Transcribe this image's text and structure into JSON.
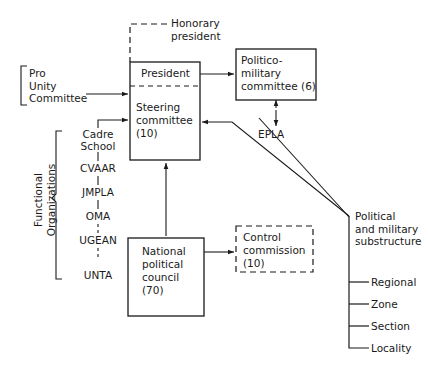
{
  "diagram": {
    "line_color": "#1a1a1a",
    "text_color": "#1a1a1a",
    "background": "#ffffff"
  },
  "nodes": {
    "honorary_president": {
      "label": "Honorary\npresident",
      "style": "dashed-connector-label"
    },
    "pro_unity_committee": {
      "label": "Pro\nUnity\nCommittee",
      "style": "bracket-group"
    },
    "president": {
      "label": "President",
      "style": "solid-box-upper-compartment"
    },
    "steering_committee": {
      "label": "Steering\ncommittee\n(10)",
      "count": "(10)",
      "style": "solid-box-lower-compartment"
    },
    "politico_military_committee": {
      "label": "Politico-\nmilitary\ncommittee (6)",
      "count": "(6)",
      "style": "solid-box"
    },
    "epla": {
      "label": "EPLA",
      "style": "edge-label"
    },
    "national_political_council": {
      "label": "National\npolitical\ncouncil\n(70)",
      "count": "(70)",
      "style": "solid-box"
    },
    "control_commission": {
      "label": "Control\ncommission\n(10)",
      "count": "(10)",
      "style": "dashed-box"
    },
    "political_military_substructure": {
      "label": "Political\nand military\nsubstructure",
      "style": "tree-heading"
    }
  },
  "functional_organizations": {
    "group_label": "Functional\nOrganizations",
    "items": [
      {
        "label": "Cadre\nSchool"
      },
      {
        "label": "CVAAR"
      },
      {
        "label": "JMPLA"
      },
      {
        "label": "OMA"
      },
      {
        "label": "UGEAN"
      },
      {
        "label": "UNTA"
      }
    ]
  },
  "substructure_levels": [
    {
      "label": "Regional"
    },
    {
      "label": "Zone"
    },
    {
      "label": "Section"
    },
    {
      "label": "Locality"
    }
  ]
}
